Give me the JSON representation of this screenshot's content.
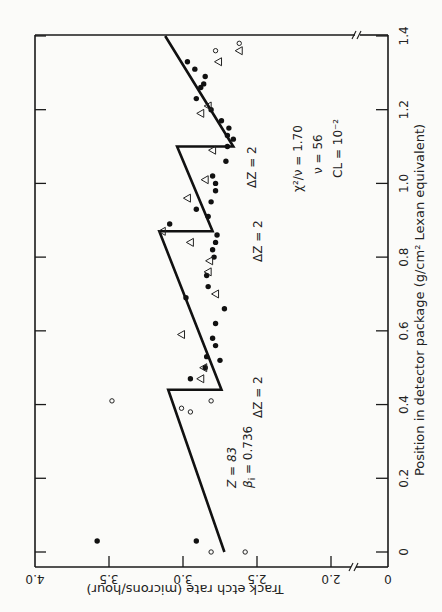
{
  "chart_data": {
    "type": "scatter",
    "orientation": "rotated 90 degrees clockwise (x-axis runs along right side bottom-to-top, y-axis along bottom, inverted)",
    "xlabel": "Position in detector package (g/cm² Lexan equivalent)",
    "ylabel": "Track etch rate (microns/hour)",
    "x_ticks": [
      "0",
      "0.2",
      "0.4",
      "0.6",
      "0.8",
      "1.0",
      "1.2",
      "1.4"
    ],
    "y_ticks": [
      "4.0",
      "3.5",
      "3.0",
      "2.5",
      "2.0",
      "0"
    ],
    "xlim": [
      0,
      1.4
    ],
    "ylim": [
      0,
      4.0
    ],
    "y_axis_break": "between 0 and 2.0",
    "grid": false,
    "series": [
      {
        "name": "model fit",
        "type": "line",
        "points": [
          [
            0.0,
            2.72
          ],
          [
            0.44,
            3.1
          ],
          [
            0.44,
            2.74
          ],
          [
            0.87,
            3.16
          ],
          [
            0.87,
            2.8
          ],
          [
            1.1,
            3.04
          ],
          [
            1.1,
            2.66
          ],
          [
            1.4,
            3.12
          ]
        ]
      },
      {
        "name": "filled circles",
        "marker": "filled-circle",
        "points": [
          [
            0.03,
            3.58
          ],
          [
            0.03,
            2.91
          ],
          [
            0.47,
            2.95
          ],
          [
            0.5,
            2.85
          ],
          [
            0.52,
            2.75
          ],
          [
            0.53,
            2.84
          ],
          [
            0.56,
            2.78
          ],
          [
            0.58,
            2.8
          ],
          [
            0.62,
            2.78
          ],
          [
            0.66,
            2.72
          ],
          [
            0.69,
            2.98
          ],
          [
            0.72,
            2.83
          ],
          [
            0.75,
            2.84
          ],
          [
            0.8,
            2.79
          ],
          [
            0.82,
            2.8
          ],
          [
            0.84,
            2.78
          ],
          [
            0.86,
            2.77
          ],
          [
            0.89,
            3.09
          ],
          [
            0.91,
            2.83
          ],
          [
            0.93,
            2.91
          ],
          [
            0.95,
            2.81
          ],
          [
            0.98,
            2.78
          ],
          [
            1.0,
            2.78
          ],
          [
            1.02,
            2.8
          ],
          [
            1.06,
            2.71
          ],
          [
            1.1,
            2.7
          ],
          [
            1.12,
            2.66
          ],
          [
            1.13,
            2.7
          ],
          [
            1.15,
            2.69
          ],
          [
            1.17,
            2.74
          ],
          [
            1.2,
            2.81
          ],
          [
            1.23,
            2.91
          ],
          [
            1.26,
            2.88
          ],
          [
            1.27,
            2.86
          ],
          [
            1.29,
            2.85
          ],
          [
            1.31,
            2.92
          ],
          [
            1.33,
            2.97
          ]
        ]
      },
      {
        "name": "open triangles",
        "marker": "open-triangle",
        "points": [
          [
            0.47,
            2.88
          ],
          [
            0.5,
            2.86
          ],
          [
            0.59,
            3.01
          ],
          [
            0.7,
            2.78
          ],
          [
            0.76,
            2.83
          ],
          [
            0.79,
            2.82
          ],
          [
            0.84,
            2.95
          ],
          [
            0.87,
            3.14
          ],
          [
            0.96,
            2.97
          ],
          [
            1.01,
            2.85
          ],
          [
            1.09,
            2.8
          ],
          [
            1.19,
            2.88
          ],
          [
            1.21,
            2.83
          ],
          [
            1.33,
            2.76
          ],
          [
            1.36,
            2.62
          ]
        ]
      },
      {
        "name": "open circles",
        "marker": "open-circle",
        "points": [
          [
            0.0,
            2.81
          ],
          [
            0.0,
            2.58
          ],
          [
            0.41,
            2.81
          ],
          [
            0.41,
            3.48
          ],
          [
            0.39,
            3.01
          ],
          [
            0.38,
            2.95
          ],
          [
            1.36,
            2.78
          ],
          [
            1.38,
            2.62
          ]
        ]
      }
    ],
    "annotations": [
      {
        "text": "Z = 83",
        "x": 0.08,
        "y": 2.55
      },
      {
        "text": "βi = 0.736",
        "x": 0.08,
        "y": 2.47
      },
      {
        "text": "ΔZ = 2",
        "x": 0.38,
        "y": 2.45
      },
      {
        "text": "ΔZ = 2",
        "x": 0.83,
        "y": 2.45
      },
      {
        "text": "ΔZ = 2",
        "x": 1.04,
        "y": 2.42
      },
      {
        "text": "χ²/ν = 1.70",
        "x": 1.07,
        "y": 2.22
      },
      {
        "text": "ν = 56",
        "x": 1.07,
        "y": 2.14
      },
      {
        "text": "CL = 10⁻²",
        "x": 1.07,
        "y": 2.06
      }
    ]
  },
  "labels": {
    "xlabel": "Position in detector package (g/cm² Lexan equivalent)",
    "ylabel": "Track etch rate (microns/hour)",
    "z_label": "Z = 83",
    "beta_label": "β",
    "beta_sub": "i",
    "beta_value": " = 0.736",
    "dz1": "ΔZ = 2",
    "dz2": "ΔZ = 2",
    "dz3": "ΔZ = 2",
    "chi_label": "χ²/ν = 1.70",
    "nu_label": "ν = 56",
    "cl_label": "CL = 10⁻²"
  }
}
